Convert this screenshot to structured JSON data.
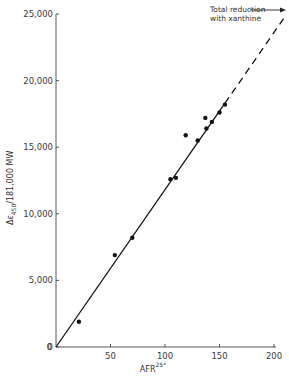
{
  "chart_data": {
    "type": "scatter",
    "title": "",
    "xlabel": "AFR",
    "xlabel_superscript": "25*",
    "ylabel": "Δε450 /181,000 MW",
    "ylabel_parts": {
      "delta": "Δ",
      "epsilon": "ε",
      "subscript": "450",
      "rest": " /181,000 MW"
    },
    "xlim": [
      0,
      200
    ],
    "ylim": [
      0,
      25000
    ],
    "grid": false,
    "x_ticks": [
      0,
      50,
      100,
      150,
      200
    ],
    "x_tick_labels": [
      "0",
      "50",
      "100",
      "150",
      "200"
    ],
    "y_ticks": [
      0,
      5000,
      10000,
      15000,
      20000,
      25000
    ],
    "y_tick_labels": [
      "0",
      "5,000",
      "10,000",
      "15,000",
      "20,000",
      "25,000"
    ],
    "series": [
      {
        "name": "data points",
        "style": "filled-circle",
        "x": [
          21,
          54,
          70,
          105,
          110,
          119,
          130,
          137,
          138,
          143,
          150,
          155
        ],
        "y": [
          1900,
          6900,
          8200,
          12600,
          12700,
          15900,
          15500,
          17200,
          16400,
          16900,
          17600,
          18200
        ]
      },
      {
        "name": "fit line (solid)",
        "style": "solid-line",
        "x": [
          0,
          155
        ],
        "y": [
          0,
          18300
        ]
      },
      {
        "name": "extrapolation (dashed)",
        "style": "dashed-line",
        "x": [
          155,
          210
        ],
        "y": [
          18300,
          24800
        ]
      }
    ],
    "annotations": [
      {
        "text_line1": "Total reduction",
        "text_line2": "with xanthine",
        "arrow_to": {
          "x": 210,
          "y": 24800
        }
      }
    ]
  },
  "axes": {
    "x_title": "AFR",
    "x_title_sup": "25*",
    "y_title_delta": "Δε",
    "y_title_sub": "450",
    "y_title_rest": "/181,000 MW"
  },
  "annotation": {
    "line1": "Total reduction",
    "line2": "with xanthine"
  }
}
